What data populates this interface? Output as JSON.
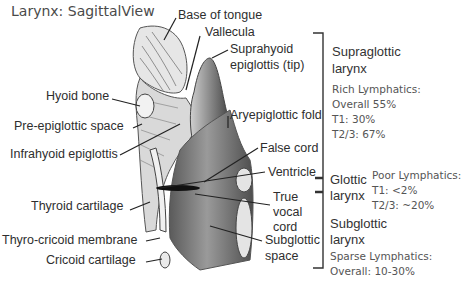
{
  "title": "Larynx: SagittalView",
  "anatomy_labels_left": {
    "hyoid_bone": "Hyoid bone",
    "pre_epiglottic_space": "Pre-epiglottic space",
    "infrahyoid_epiglottis": "Infrahyoid epiglottis",
    "thyroid_cartilage": "Thyroid cartilage",
    "thyro_cricoid_membrane": "Thyro-cricoid membrane",
    "cricoid_cartilage": "Cricoid cartilage"
  },
  "anatomy_labels_right": {
    "base_of_tongue": "Base of tongue",
    "vallecula": "Vallecula",
    "suprahyoid_line1": "Suprahyoid",
    "suprahyoid_line2": "epiglottis (tip)",
    "aryepiglottic_fold": "Aryepiglottic fold",
    "false_cord": "False cord",
    "ventricle": "Ventricle",
    "true_vocal_cord": [
      "True",
      "vocal",
      "cord"
    ],
    "subglottic_space": [
      "Subglottic",
      "space"
    ]
  },
  "regions": [
    {
      "name": [
        "Supraglottic",
        "larynx"
      ],
      "lymphatics": "Rich Lymphatics:",
      "stats": [
        "Overall 55%",
        "T1: 30%",
        "T2/3: 67%"
      ]
    },
    {
      "name": [
        "Glottic",
        "larynx"
      ],
      "lymphatics": "Poor Lymphatics:",
      "stats": [
        "T1: <2%",
        "T2/3: ~20%"
      ]
    },
    {
      "name": [
        "Subglottic",
        "larynx"
      ],
      "lymphatics": "Sparse Lymphatics:",
      "stats": [
        "Overall: 10-30%"
      ]
    }
  ],
  "colors": {
    "background": "#ffffff",
    "text": "#2e2e2e",
    "note_text": "#555555",
    "bracket": "#333333",
    "tissue_dark": "#4a4a4a",
    "tissue_mid": "#8a8a8a",
    "tissue_light": "#d6d6d6"
  }
}
